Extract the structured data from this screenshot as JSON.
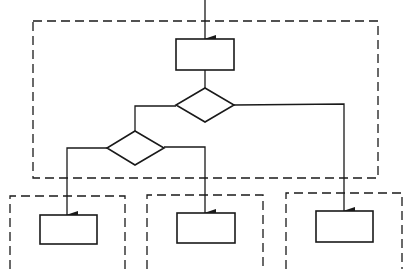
{
  "diagram": {
    "type": "flowchart",
    "colors": {
      "stroke": "#1a1a1a",
      "background": "#ffffff"
    },
    "containers": [
      {
        "id": "outer-block",
        "style": "dashed",
        "x": 33,
        "y": 20,
        "w": 345,
        "h": 158
      },
      {
        "id": "branch-1-block",
        "style": "dashed",
        "x": 10,
        "y": 196,
        "w": 115,
        "h": 80,
        "open_bottom": true
      },
      {
        "id": "branch-2-block",
        "style": "dashed",
        "x": 147,
        "y": 195,
        "w": 116,
        "h": 80,
        "open_bottom": true
      },
      {
        "id": "branch-3-block",
        "style": "dashed",
        "x": 286,
        "y": 193,
        "w": 116,
        "h": 82,
        "open_bottom": true
      }
    ],
    "nodes": [
      {
        "id": "process-top",
        "shape": "rect",
        "x": 176,
        "y": 39,
        "w": 58,
        "h": 31,
        "label": ""
      },
      {
        "id": "decision-1",
        "shape": "diamond",
        "cx": 205,
        "cy": 105,
        "hw": 29,
        "hh": 17,
        "label": ""
      },
      {
        "id": "decision-2",
        "shape": "diamond",
        "cx": 135,
        "cy": 148,
        "hw": 28,
        "hh": 17,
        "label": ""
      },
      {
        "id": "process-branch-1",
        "shape": "rect",
        "x": 40,
        "y": 215,
        "w": 57,
        "h": 29,
        "label": ""
      },
      {
        "id": "process-branch-2",
        "shape": "rect",
        "x": 177,
        "y": 213,
        "w": 58,
        "h": 30,
        "label": ""
      },
      {
        "id": "process-branch-3",
        "shape": "rect",
        "x": 316,
        "y": 211,
        "w": 57,
        "h": 31,
        "label": ""
      }
    ],
    "edges": [
      {
        "from": "entry",
        "to": "process-top",
        "arrow": true
      },
      {
        "from": "process-top",
        "to": "decision-1",
        "arrow": false
      },
      {
        "from": "decision-1",
        "to": "decision-2",
        "arrow": false
      },
      {
        "from": "decision-1",
        "to": "process-branch-3",
        "arrow": true
      },
      {
        "from": "decision-2",
        "to": "process-branch-1",
        "arrow": true
      },
      {
        "from": "decision-2",
        "to": "process-branch-2",
        "arrow": true
      }
    ]
  }
}
